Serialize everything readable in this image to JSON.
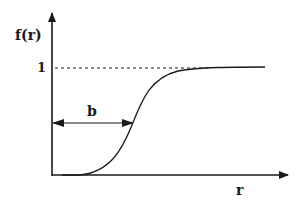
{
  "diagram": {
    "y_axis_label": "f(r)",
    "x_axis_label": "r",
    "level_label": "1",
    "width_label": "b",
    "curve_description": "sigmoid rising from 0 to asymptote 1",
    "colors": {
      "ink": "#1a1a1a",
      "background": "#ffffff"
    }
  }
}
